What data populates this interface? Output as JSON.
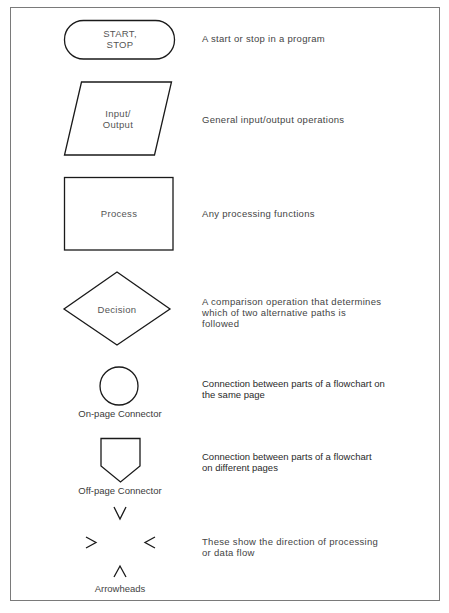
{
  "symbols": [
    {
      "id": "terminator",
      "shape_label": "START,\nSTOP",
      "description": "A start or stop in a program"
    },
    {
      "id": "input-output",
      "shape_label": "Input/\nOutput",
      "description": "General input/output operations"
    },
    {
      "id": "process",
      "shape_label": "Process",
      "description": "Any processing functions"
    },
    {
      "id": "decision",
      "shape_label": "Decision",
      "description": "A comparison operation that determines\nwhich of two alternative paths is\nfollowed"
    },
    {
      "id": "on-page-connector",
      "caption": "On-page Connector",
      "description": "Connection between parts of a flowchart on\nthe same page"
    },
    {
      "id": "off-page-connector",
      "caption": "Off-page Connector",
      "description": "Connection between parts of a flowchart\non different pages"
    },
    {
      "id": "arrowheads",
      "caption": "Arrowheads",
      "description": "These show the direction of processing\nor data flow"
    }
  ],
  "colors": {
    "stroke": "#1a1a1a",
    "frame": "#7a7a7a",
    "text": "#444444"
  }
}
